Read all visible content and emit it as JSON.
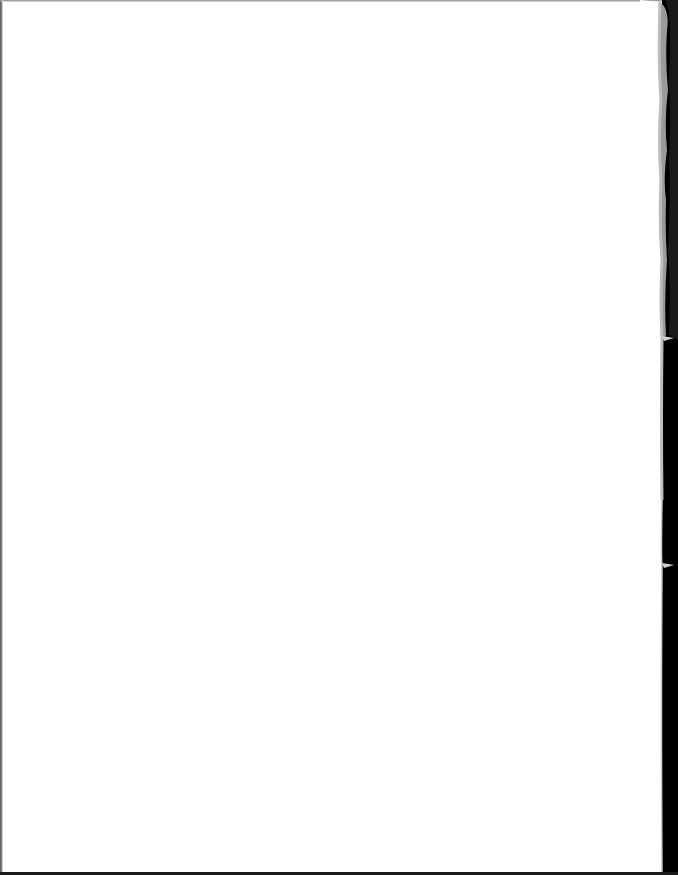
{
  "page": {
    "type": "scanned-blank-page",
    "content_text": "",
    "colors": {
      "paper": "#ffffff",
      "scanner_background": "#000000",
      "torn_edge_shadow": "#9a9a9a"
    }
  }
}
